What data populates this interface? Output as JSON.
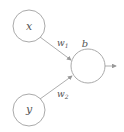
{
  "diagram": {
    "type": "perceptron",
    "nodes": [
      {
        "id": "x",
        "label": "x",
        "cx": 29,
        "cy": 26,
        "r": 16
      },
      {
        "id": "y",
        "label": "y",
        "cx": 29,
        "cy": 110,
        "r": 16
      },
      {
        "id": "out",
        "label": "",
        "cx": 88,
        "cy": 66,
        "r": 17
      }
    ],
    "bias_label": "b",
    "edges": [
      {
        "from": "x",
        "to": "out",
        "weight_label": "w",
        "weight_sub": "1"
      },
      {
        "from": "y",
        "to": "out",
        "weight_label": "w",
        "weight_sub": "2"
      }
    ],
    "colors": {
      "stroke": "#aaaaaa",
      "text": "#555555"
    }
  }
}
